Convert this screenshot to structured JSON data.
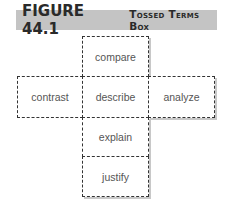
{
  "figure": {
    "number": "FIGURE 44.1",
    "title": "Tossed Terms Box"
  },
  "terms": {
    "top": "compare",
    "left": "contrast",
    "center": "describe",
    "right": "analyze",
    "below_center": "explain",
    "bottom": "justify"
  }
}
